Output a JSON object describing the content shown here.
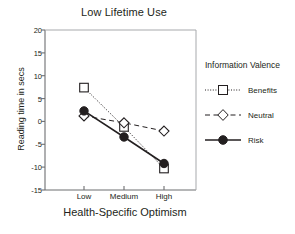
{
  "chart_data": {
    "type": "line",
    "title": "Low Lifetime Use",
    "xlabel": "Health-Specific Optimism",
    "ylabel": "Reading time in secs",
    "categories": [
      "Low",
      "Medium",
      "High"
    ],
    "ylim": [
      -15,
      20
    ],
    "yticks": [
      20,
      15,
      10,
      5,
      0,
      -5,
      -10,
      -15
    ],
    "ytick_labels": [
      "20",
      "15",
      "10",
      "5",
      "0",
      "-5",
      "-10",
      "-15"
    ],
    "grid": false,
    "legend_position": "right",
    "legend_title": "Information Valence",
    "series": [
      {
        "name": "Benefits",
        "values": [
          7.4,
          -1.2,
          -10.3
        ],
        "marker": "open-square",
        "line_style": "dotted",
        "color": "#231f20"
      },
      {
        "name": "Neutral",
        "values": [
          1.2,
          -0.3,
          -2.1
        ],
        "marker": "open-diamond",
        "line_style": "dashed",
        "color": "#231f20"
      },
      {
        "name": "Risk",
        "values": [
          2.3,
          -3.4,
          -9.2
        ],
        "marker": "filled-circle",
        "line_style": "solid",
        "color": "#231f20"
      }
    ]
  },
  "legend": {
    "title": "Information Valence",
    "items": [
      {
        "label": "Benefits"
      },
      {
        "label": "Neutral"
      },
      {
        "label": "Risk"
      }
    ]
  },
  "colors": {
    "ink": "#231f20",
    "axis": "#6d6e71",
    "background": "#ffffff"
  }
}
